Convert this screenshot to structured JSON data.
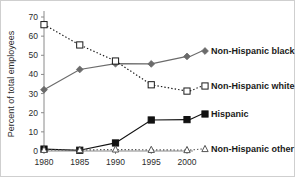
{
  "chart_data": {
    "type": "line",
    "title": "",
    "xlabel": "",
    "ylabel": "Percent of total employees",
    "x": [
      1980,
      1985,
      1990,
      1995,
      2000
    ],
    "xtick_labels": [
      "1980",
      "1985",
      "1990",
      "1995",
      "2000"
    ],
    "ytick_labels": [
      "0",
      "10",
      "20",
      "30",
      "40",
      "50",
      "60",
      "70"
    ],
    "ytick_values": [
      0,
      10,
      20,
      30,
      40,
      50,
      60,
      70
    ],
    "xlim": [
      1978,
      2002
    ],
    "ylim": [
      0,
      70
    ],
    "grid": false,
    "legend_position": "right-inline",
    "series": [
      {
        "name": "Non-Hispanic black",
        "values": [
          32.0,
          42.6,
          45.6,
          45.5,
          49.4
        ],
        "marker": "diamond-filled",
        "line_style": "solid",
        "color": "#6b6b6b"
      },
      {
        "name": "Non-Hispanic white",
        "values": [
          66.0,
          55.4,
          47.0,
          34.6,
          31.3
        ],
        "marker": "square-open",
        "line_style": "dotted",
        "color": "#1a1a1a"
      },
      {
        "name": "Hispanic",
        "values": [
          1.0,
          0.4,
          4.2,
          16.2,
          16.4
        ],
        "marker": "square-filled",
        "line_style": "solid",
        "color": "#111111"
      },
      {
        "name": "Non-Hispanic other",
        "values": [
          0.6,
          0.5,
          0.8,
          0.6,
          0.5
        ],
        "marker": "triangle-open",
        "line_style": "dotted",
        "color": "#555555"
      }
    ]
  },
  "colors": {
    "black_series": "#6b6b6b",
    "white_series": "#1a1a1a",
    "hispanic_series": "#111111",
    "other_series": "#555555",
    "axis": "#8a8a8a",
    "text": "#2b2b2b"
  }
}
